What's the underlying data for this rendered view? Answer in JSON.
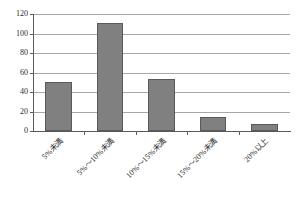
{
  "chart_data": {
    "type": "bar",
    "title": "",
    "categories": [
      "5%未満",
      "5%～10%未満",
      "10%～15%未満",
      "15%～20%未満",
      "20%以上"
    ],
    "values": [
      50,
      111,
      53,
      14,
      7
    ],
    "xlabel": "",
    "ylabel": "",
    "ylim": [
      0,
      120
    ],
    "ytick_labels": [
      "120",
      "100",
      "80",
      "60",
      "40",
      "20",
      "0"
    ],
    "ytick_values": [
      120,
      100,
      80,
      60,
      40,
      20,
      0
    ],
    "grid": true,
    "legend": false,
    "bar_color": "#808080",
    "bar_border_color": "#595959",
    "grid_color": "#a8a8a8",
    "axis_color": "#5a5a5a",
    "background": "#ffffff"
  }
}
